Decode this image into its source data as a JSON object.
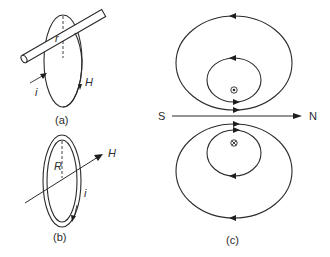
{
  "figure": {
    "panel_a": {
      "caption": "(a)",
      "radius_label": "r",
      "current_label": "i",
      "field_label": "H"
    },
    "panel_b": {
      "caption": "(b)",
      "radius_label": "R",
      "current_label": "i",
      "field_label": "H"
    },
    "panel_c": {
      "caption": "(c)",
      "south_label": "S",
      "north_label": "N",
      "out_of_page_symbol": "⊙",
      "into_page_symbol": "⊗"
    }
  },
  "colors": {
    "line": "#2b2b2b",
    "background": "#ffffff"
  }
}
